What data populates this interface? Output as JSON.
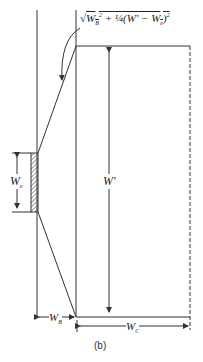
{
  "diagram": {
    "formula": {
      "radical": "√",
      "term1": "W",
      "term1_sub": "B",
      "term1_sup": "2",
      "plus": " + ",
      "fraction": "¼",
      "paren_open": "(W' − W",
      "sub_e": "e",
      "paren_close": ")",
      "sup2": "2"
    },
    "labels": {
      "we": "W",
      "we_sub": "e",
      "wprime": "W'",
      "wb": "W",
      "wb_sub": "B",
      "wc": "W",
      "wc_sub": "C"
    },
    "caption": "(b)",
    "colors": {
      "line": "#333333",
      "background": "#ffffff"
    }
  }
}
